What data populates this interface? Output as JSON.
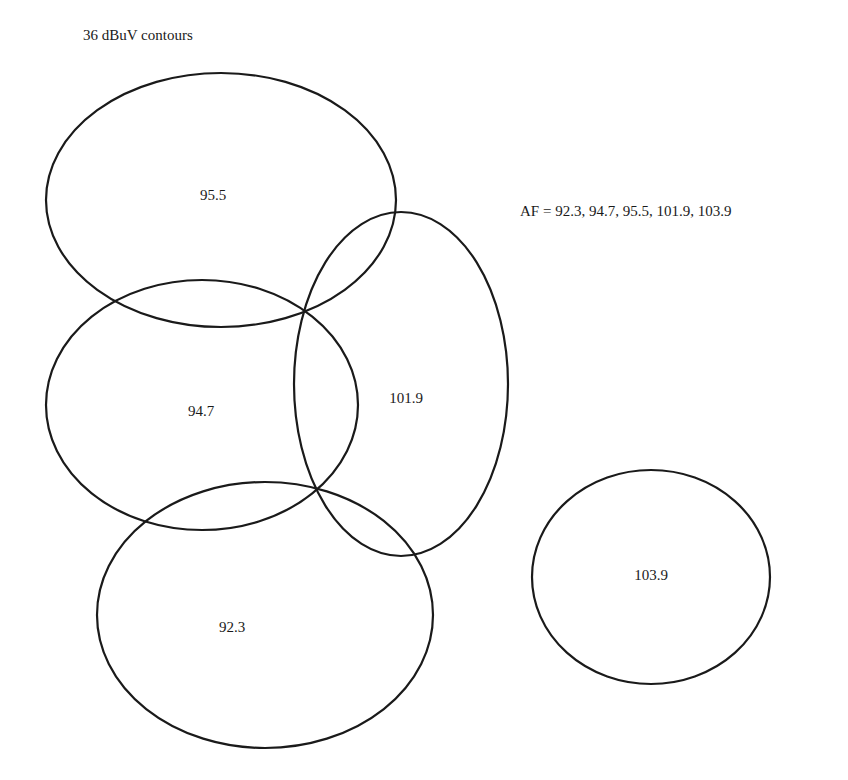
{
  "title": "36 dBuV contours",
  "af_label": "AF = 92.3, 94.7, 95.5, 101.9, 103.9",
  "stroke_color": "#1a1a1a",
  "contours": [
    {
      "label": "95.5",
      "cx": 221,
      "cy": 200,
      "rx": 175,
      "ry": 127,
      "label_x": 213,
      "label_y": 195
    },
    {
      "label": "94.7",
      "cx": 202,
      "cy": 405,
      "rx": 156,
      "ry": 125,
      "label_x": 201,
      "label_y": 411
    },
    {
      "label": "101.9",
      "cx": 401,
      "cy": 384,
      "rx": 107,
      "ry": 172,
      "label_x": 406,
      "label_y": 398
    },
    {
      "label": "92.3",
      "cx": 265,
      "cy": 615,
      "rx": 168,
      "ry": 133,
      "label_x": 232,
      "label_y": 627
    },
    {
      "label": "103.9",
      "cx": 651,
      "cy": 577,
      "rx": 119,
      "ry": 107,
      "label_x": 651,
      "label_y": 575
    }
  ]
}
